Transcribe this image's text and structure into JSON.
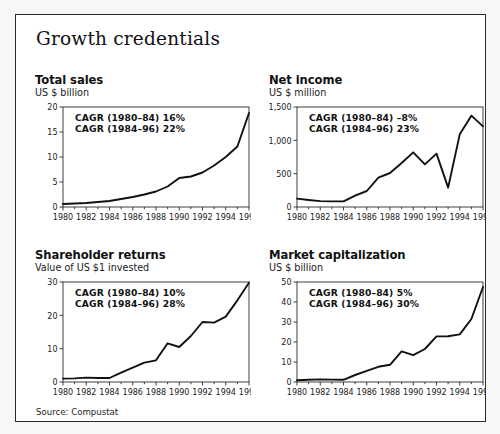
{
  "figure": {
    "title": "Growth credentials",
    "source": "Source: Compustat",
    "frame_color": "#2b2b2b",
    "line_color": "#111111",
    "background": "#ffffff"
  },
  "chart_data": [
    {
      "type": "line",
      "panel_index": 0,
      "title": "Total sales",
      "subtitle": "US $ billion",
      "xlabel": "",
      "ylabel": "US $ billion",
      "grid": false,
      "legend": "none",
      "xlim": [
        1980,
        1996
      ],
      "ylim": [
        0,
        20
      ],
      "yticks": [
        0,
        5,
        10,
        15,
        20
      ],
      "yticklabels": [
        "0",
        "5",
        "10",
        "15",
        "20"
      ],
      "xticks": [
        1980,
        1982,
        1984,
        1986,
        1988,
        1990,
        1992,
        1994,
        1996
      ],
      "xticklabels": [
        "1980",
        "1982",
        "1984",
        "1986",
        "1988",
        "1990",
        "1992",
        "1994",
        "1996"
      ],
      "x": [
        1980,
        1981,
        1982,
        1983,
        1984,
        1985,
        1986,
        1987,
        1988,
        1989,
        1990,
        1991,
        1992,
        1993,
        1994,
        1995,
        1996
      ],
      "values": [
        0.6,
        0.7,
        0.8,
        1.0,
        1.2,
        1.6,
        2.0,
        2.5,
        3.1,
        4.1,
        5.8,
        6.1,
        6.9,
        8.3,
        10.0,
        12.1,
        18.8
      ],
      "annotations": [
        "CAGR (1980–84) 16%",
        "CAGR (1984–96) 22%"
      ]
    },
    {
      "type": "line",
      "panel_index": 1,
      "title": "Net income",
      "subtitle": "US $ million",
      "xlabel": "",
      "ylabel": "US $ million",
      "grid": false,
      "legend": "none",
      "xlim": [
        1980,
        1996
      ],
      "ylim": [
        0,
        1500
      ],
      "yticks": [
        0,
        500,
        1000,
        1500
      ],
      "yticklabels": [
        "0",
        "500",
        "1,000",
        "1,500"
      ],
      "xticks": [
        1980,
        1982,
        1984,
        1986,
        1988,
        1990,
        1992,
        1994,
        1996
      ],
      "xticklabels": [
        "1980",
        "1982",
        "1984",
        "1986",
        "1988",
        "1990",
        "1992",
        "1994",
        "1996"
      ],
      "x": [
        1980,
        1981,
        1982,
        1983,
        1984,
        1985,
        1986,
        1987,
        1988,
        1989,
        1990,
        1991,
        1992,
        1993,
        1994,
        1995,
        1996
      ],
      "values": [
        125,
        105,
        88,
        85,
        85,
        170,
        240,
        440,
        510,
        660,
        820,
        640,
        800,
        290,
        1090,
        1370,
        1210
      ],
      "annotations": [
        "CAGR (1980–84) –8%",
        "CAGR (1984–96) 23%"
      ]
    },
    {
      "type": "line",
      "panel_index": 2,
      "title": "Shareholder returns",
      "subtitle": "Value of US $1 invested",
      "xlabel": "",
      "ylabel": "Value of US $1 invested",
      "grid": false,
      "legend": "none",
      "xlim": [
        1980,
        1996
      ],
      "ylim": [
        0,
        30
      ],
      "yticks": [
        0,
        10,
        20,
        30
      ],
      "yticklabels": [
        "0",
        "10",
        "20",
        "30"
      ],
      "xticks": [
        1980,
        1982,
        1984,
        1986,
        1988,
        1990,
        1992,
        1994,
        1996
      ],
      "xticklabels": [
        "1980",
        "1982",
        "1984",
        "1986",
        "1988",
        "1990",
        "1992",
        "1994",
        "1996"
      ],
      "x": [
        1980,
        1981,
        1982,
        1983,
        1984,
        1985,
        1986,
        1987,
        1988,
        1989,
        1990,
        1991,
        1992,
        1993,
        1994,
        1995,
        1996
      ],
      "values": [
        1.0,
        1.1,
        1.3,
        1.2,
        1.2,
        2.8,
        4.3,
        5.8,
        6.5,
        11.6,
        10.5,
        13.8,
        18.0,
        17.8,
        19.6,
        24.5,
        29.8
      ],
      "annotations": [
        "CAGR (1980–84) 10%",
        "CAGR (1984–96) 28%"
      ]
    },
    {
      "type": "line",
      "panel_index": 3,
      "title": "Market capitalization",
      "subtitle": "US $ billion",
      "xlabel": "",
      "ylabel": "US $ billion",
      "grid": false,
      "legend": "none",
      "xlim": [
        1980,
        1996
      ],
      "ylim": [
        0,
        50
      ],
      "yticks": [
        0,
        10,
        20,
        30,
        40,
        50
      ],
      "yticklabels": [
        "0",
        "10",
        "20",
        "30",
        "40",
        "50"
      ],
      "xticks": [
        1980,
        1982,
        1984,
        1986,
        1988,
        1990,
        1992,
        1994,
        1996
      ],
      "xticklabels": [
        "1980",
        "1982",
        "1984",
        "1986",
        "1988",
        "1990",
        "1992",
        "1994",
        "1996"
      ],
      "x": [
        1980,
        1981,
        1982,
        1983,
        1984,
        1985,
        1986,
        1987,
        1988,
        1989,
        1990,
        1991,
        1992,
        1993,
        1994,
        1995,
        1996
      ],
      "values": [
        0.9,
        1.1,
        1.3,
        1.2,
        1.1,
        3.5,
        5.6,
        7.6,
        8.6,
        15.3,
        13.4,
        16.5,
        22.8,
        22.9,
        23.8,
        31.5,
        47.5
      ],
      "annotations": [
        "CAGR (1980–84) 5%",
        "CAGR (1984–96) 30%"
      ]
    }
  ]
}
